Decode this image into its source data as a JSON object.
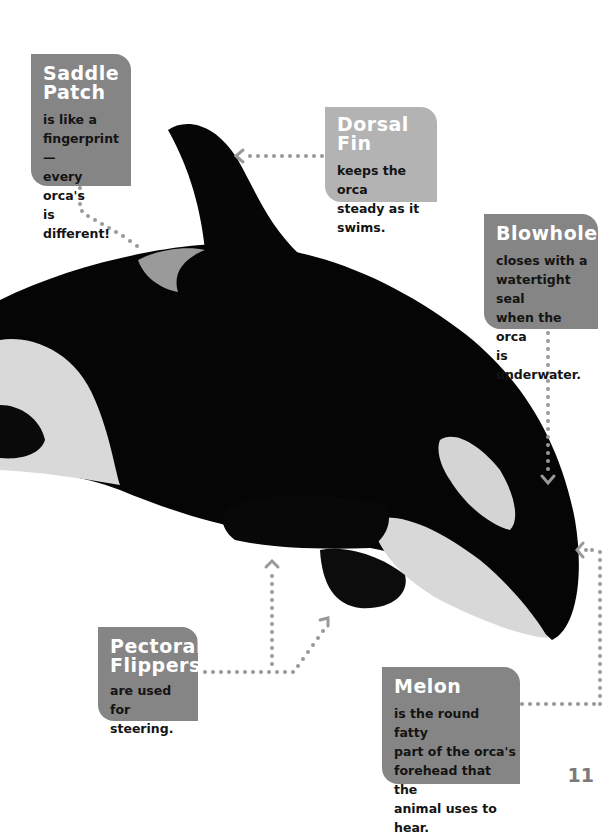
{
  "colors": {
    "callout_dark": "#858585",
    "callout_light": "#b3b3b3",
    "heading_text": "#ffffff",
    "body_text": "#141414",
    "leader_dots": "#999999",
    "page_number": "#7a7a7a"
  },
  "image": {
    "subject": "orca",
    "icon": "orca-photo"
  },
  "callouts": {
    "saddle_patch": {
      "title_line1": "Saddle",
      "title_line2": "Patch",
      "body": [
        "is like a",
        "fingerprint—",
        "every orca's",
        "is different!"
      ]
    },
    "dorsal_fin": {
      "title": "Dorsal Fin",
      "body": [
        "keeps the orca",
        "steady as it",
        "swims."
      ]
    },
    "blowhole": {
      "title": "Blowhole",
      "body": [
        "closes with a",
        "watertight seal",
        "when the orca",
        "is underwater."
      ]
    },
    "pectoral_flippers": {
      "title_line1": "Pectoral",
      "title_line2": "Flippers",
      "body": [
        "are used for",
        "steering."
      ]
    },
    "melon": {
      "title": "Melon",
      "body": [
        "is the round fatty",
        "part of the orca's",
        "forehead that the",
        "animal uses to hear."
      ]
    }
  },
  "page_number": "11"
}
